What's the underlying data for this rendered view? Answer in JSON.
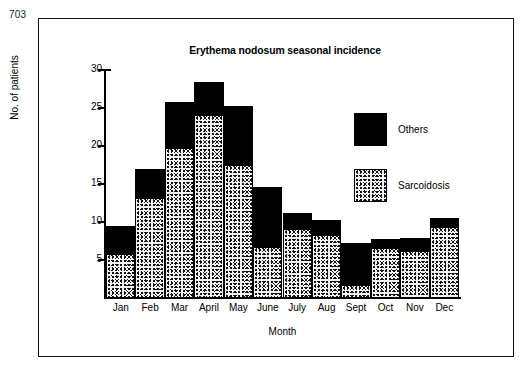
{
  "page": {
    "number": "703"
  },
  "chart_data": {
    "type": "bar",
    "subtype": "stacked-vertical",
    "title": "Erythema nodosum seasonal incidence",
    "xlabel": "Month",
    "ylabel": "No. of patients",
    "ylim": [
      0,
      30
    ],
    "yticks": [
      5,
      10,
      15,
      20,
      25,
      30
    ],
    "ytick_labels": [
      "5",
      "10",
      "15",
      "20",
      "25",
      "30"
    ],
    "grid": false,
    "legend_position": "inside-top-right",
    "categories": [
      "Jan",
      "Feb",
      "Mar",
      "April",
      "May",
      "June",
      "July",
      "Aug",
      "Sept",
      "Oct",
      "Nov",
      "Dec"
    ],
    "series": [
      {
        "name": "Sarcoidosis",
        "fill": "stipple",
        "color": "#f2f2f0",
        "values": [
          5.6,
          13.0,
          19.6,
          23.9,
          17.4,
          6.6,
          9.0,
          8.2,
          1.6,
          6.5,
          6.1,
          9.2
        ]
      },
      {
        "name": "Others",
        "fill": "solid",
        "color": "#000000",
        "values": [
          3.7,
          3.9,
          6.1,
          4.4,
          7.7,
          7.9,
          2.0,
          2.0,
          5.5,
          1.2,
          1.6,
          1.2
        ]
      }
    ],
    "totals": [
      9.3,
      16.9,
      25.7,
      28.3,
      25.1,
      14.5,
      11.0,
      10.2,
      7.1,
      7.7,
      7.7,
      10.4
    ]
  },
  "legend": {
    "entries": [
      {
        "label": "Others",
        "swatch": "solid-black"
      },
      {
        "label": "Sarcoidosis",
        "swatch": "stippled"
      }
    ]
  },
  "colors": {
    "ink": "#000000",
    "paper": "#ffffff",
    "others": "#000000",
    "sarcoidosis": "#f2f2f0"
  }
}
